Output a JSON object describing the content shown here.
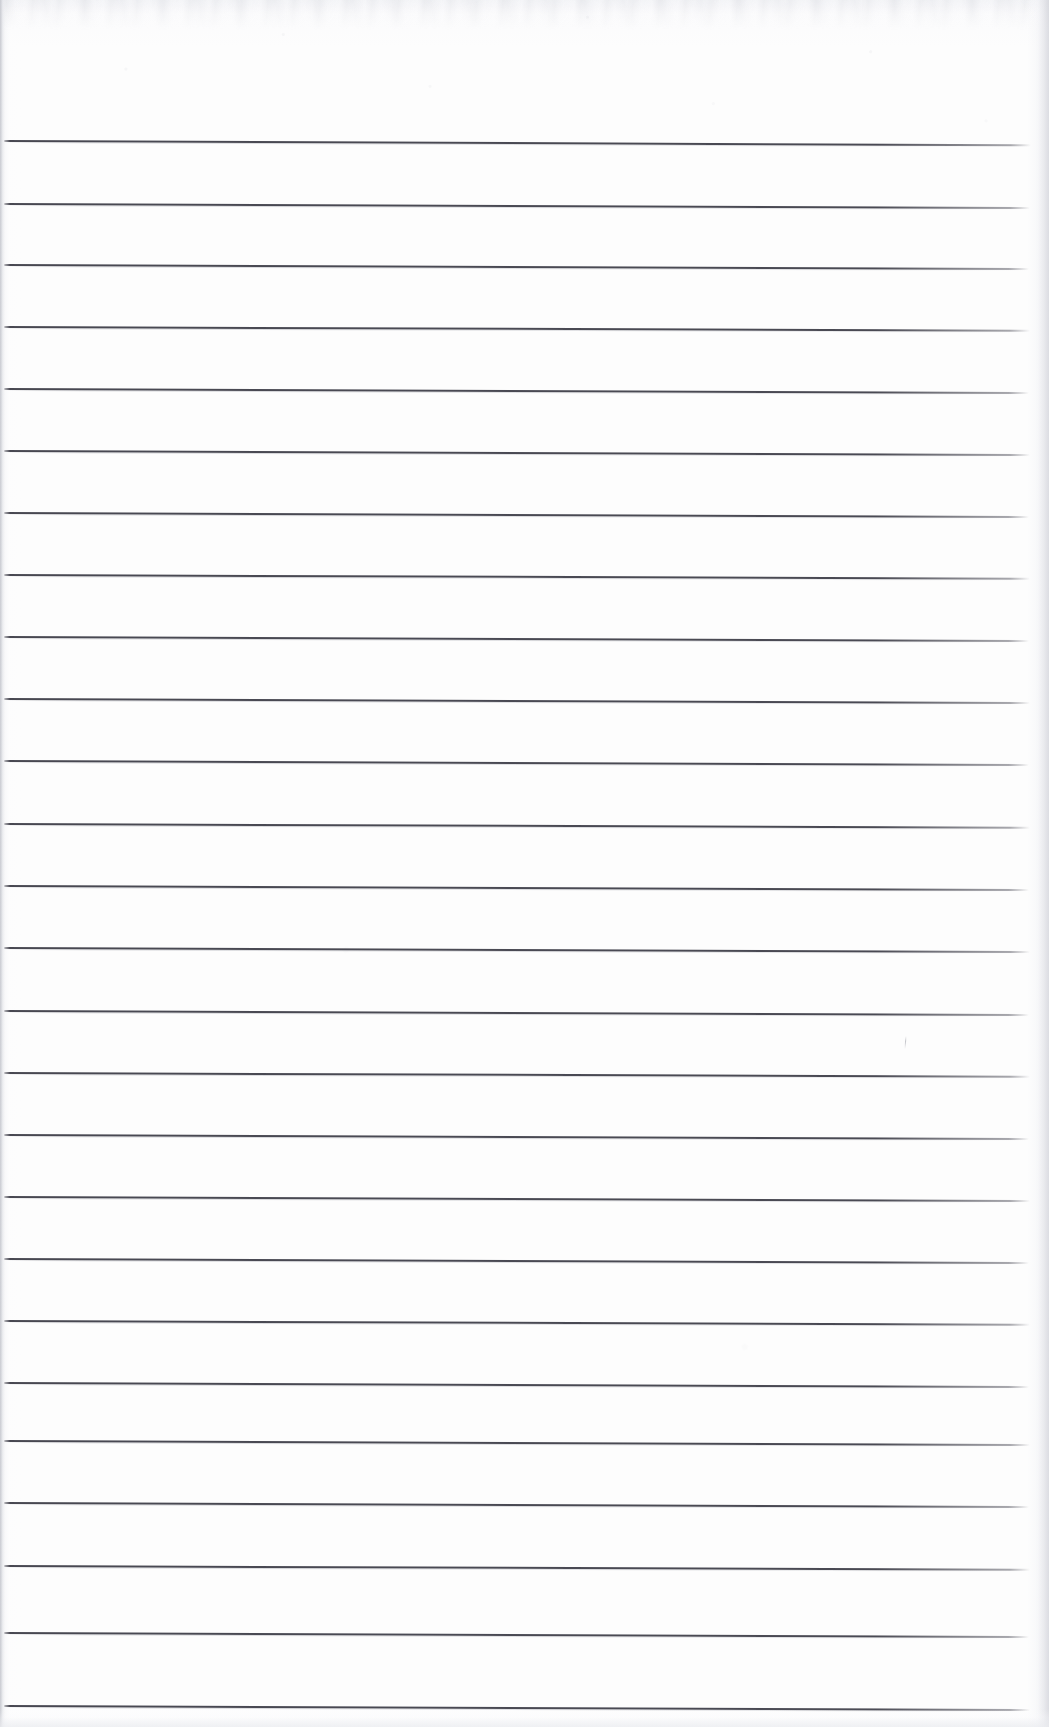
{
  "document": {
    "kind": "scanned-lined-notebook-page",
    "title": "Blank Lined Notebook Page",
    "page_text": "",
    "handwriting": "",
    "visible_text_content": "",
    "notes": "No text, headings, numbers, labels or handwriting are present on the page."
  },
  "canvas": {
    "width": 1049,
    "height": 1727
  },
  "paper": {
    "background_color": "#fdfdfd",
    "edge_shadow_color": "#c4c6cd",
    "grain_color": "#cdcfd5",
    "top_smudge_color": "#ced0d6"
  },
  "ruling": {
    "line_color": "#46464f",
    "line_thickness_px": 2,
    "line_count": 25,
    "first_line_y": 140,
    "line_spacing_px": 62,
    "last_line_y": 1705,
    "line_start_x": 4,
    "line_end_x": 1030,
    "tilt_degrees": 0.22,
    "lines": [
      {
        "index": 1,
        "y": 140,
        "x1": 4,
        "x2": 1031,
        "tilt": 0.24
      },
      {
        "index": 2,
        "y": 203,
        "x1": 4,
        "x2": 1030,
        "tilt": 0.22
      },
      {
        "index": 3,
        "y": 264,
        "x1": 4,
        "x2": 1029,
        "tilt": 0.23
      },
      {
        "index": 4,
        "y": 326,
        "x1": 4,
        "x2": 1030,
        "tilt": 0.21
      },
      {
        "index": 5,
        "y": 388,
        "x1": 4,
        "x2": 1029,
        "tilt": 0.22
      },
      {
        "index": 6,
        "y": 450,
        "x1": 4,
        "x2": 1030,
        "tilt": 0.22
      },
      {
        "index": 7,
        "y": 512,
        "x1": 4,
        "x2": 1029,
        "tilt": 0.23
      },
      {
        "index": 8,
        "y": 574,
        "x1": 4,
        "x2": 1030,
        "tilt": 0.21
      },
      {
        "index": 9,
        "y": 636,
        "x1": 4,
        "x2": 1029,
        "tilt": 0.22
      },
      {
        "index": 10,
        "y": 698,
        "x1": 4,
        "x2": 1030,
        "tilt": 0.22
      },
      {
        "index": 11,
        "y": 760,
        "x1": 4,
        "x2": 1029,
        "tilt": 0.23
      },
      {
        "index": 12,
        "y": 823,
        "x1": 4,
        "x2": 1030,
        "tilt": 0.21
      },
      {
        "index": 13,
        "y": 885,
        "x1": 4,
        "x2": 1029,
        "tilt": 0.22
      },
      {
        "index": 14,
        "y": 947,
        "x1": 4,
        "x2": 1030,
        "tilt": 0.22
      },
      {
        "index": 15,
        "y": 1010,
        "x1": 4,
        "x2": 1029,
        "tilt": 0.23
      },
      {
        "index": 16,
        "y": 1072,
        "x1": 4,
        "x2": 1030,
        "tilt": 0.21
      },
      {
        "index": 17,
        "y": 1134,
        "x1": 4,
        "x2": 1029,
        "tilt": 0.22
      },
      {
        "index": 18,
        "y": 1196,
        "x1": 4,
        "x2": 1030,
        "tilt": 0.22
      },
      {
        "index": 19,
        "y": 1258,
        "x1": 4,
        "x2": 1029,
        "tilt": 0.23
      },
      {
        "index": 20,
        "y": 1320,
        "x1": 4,
        "x2": 1030,
        "tilt": 0.21
      },
      {
        "index": 21,
        "y": 1382,
        "x1": 4,
        "x2": 1029,
        "tilt": 0.22
      },
      {
        "index": 22,
        "y": 1440,
        "x1": 4,
        "x2": 1030,
        "tilt": 0.22
      },
      {
        "index": 23,
        "y": 1502,
        "x1": 4,
        "x2": 1029,
        "tilt": 0.23
      },
      {
        "index": 24,
        "y": 1565,
        "x1": 4,
        "x2": 1030,
        "tilt": 0.21
      },
      {
        "index": 25,
        "y": 1632,
        "x1": 4,
        "x2": 1029,
        "tilt": 0.22
      },
      {
        "index": 26,
        "y": 1705,
        "x1": 4,
        "x2": 1030,
        "tilt": 0.22
      }
    ]
  },
  "marks": [
    {
      "name": "faint-pencil-tick",
      "x": 905,
      "y": 1036,
      "color": "#8a8c96"
    }
  ]
}
